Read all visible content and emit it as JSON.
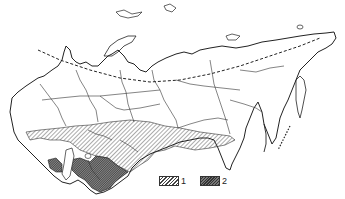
{
  "map": {
    "type": "thematic distribution map",
    "region": "USSR outline with internal administrative borders",
    "features": {
      "arctic_circle": "dashed line across northern territory",
      "zone_1": "diagonal hatched zone across southern belt",
      "zone_2": "dense dark hatched zone in southwestern area"
    },
    "colors": {
      "outline": "#222222",
      "hatch": "#444444",
      "dense": "#333333",
      "background": "#ffffff"
    }
  },
  "legend": {
    "items": [
      {
        "label": "1",
        "pattern": "hatched"
      },
      {
        "label": "2",
        "pattern": "dense-crosshatched"
      }
    ]
  }
}
